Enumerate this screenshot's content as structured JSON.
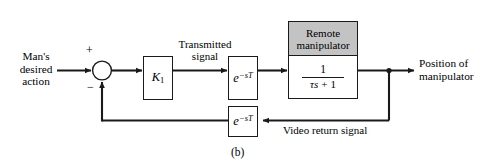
{
  "figure": {
    "caption": "(b)",
    "type": "control-system-block-diagram"
  },
  "inputs": {
    "source_label_line1": "Man's",
    "source_label_line2": "desired",
    "source_label_line3": "action"
  },
  "outputs": {
    "output_label_line1": "Position of",
    "output_label_line2": "manipulator"
  },
  "summing_junction": {
    "positive_sign": "+",
    "negative_sign": "−"
  },
  "blocks": {
    "gain": {
      "symbol": "K",
      "subscript": "1"
    },
    "forward_delay": {
      "base": "e",
      "exponent": "−sT"
    },
    "feedback_delay": {
      "base": "e",
      "exponent": "−sT"
    },
    "plant": {
      "header_line1": "Remote",
      "header_line2": "manipulator",
      "numerator": "1",
      "denominator_tau_s": "τs",
      "denominator_op": "+",
      "denominator_one": "1",
      "header_fill": "#c3c3c3"
    }
  },
  "signals": {
    "transmitted_line1": "Transmitted",
    "transmitted_line2": "signal",
    "video_return": "Video return signal"
  },
  "colors": {
    "line": "#1a1a1a",
    "background": "#ffffff",
    "shaded_header": "#c3c3c3"
  }
}
